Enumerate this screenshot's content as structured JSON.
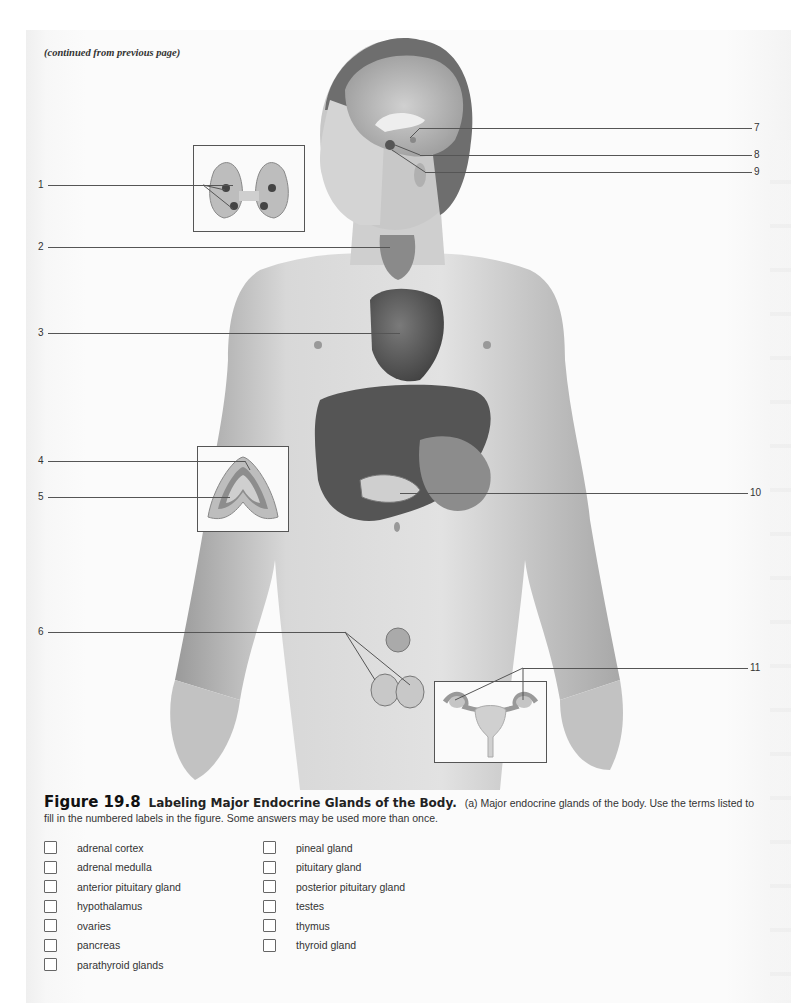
{
  "header": {
    "continued_note": "(continued from previous page)"
  },
  "figure": {
    "labels_left": [
      {
        "num": "1",
        "y": 185,
        "line_end": 233
      },
      {
        "num": "2",
        "y": 247,
        "line_end": 390
      },
      {
        "num": "3",
        "y": 333,
        "line_end": 400
      },
      {
        "num": "4",
        "y": 461,
        "line_end": 245
      },
      {
        "num": "5",
        "y": 497,
        "line_end": 230
      },
      {
        "num": "6",
        "y": 632,
        "line_end": 345
      }
    ],
    "labels_right": [
      {
        "num": "7",
        "y": 128,
        "line_start": 420
      },
      {
        "num": "8",
        "y": 155,
        "line_start": 420
      },
      {
        "num": "9",
        "y": 172,
        "line_start": 425
      },
      {
        "num": "10",
        "y": 493,
        "line_start": 400
      },
      {
        "num": "11",
        "y": 668,
        "line_start": 523
      }
    ],
    "insets": [
      {
        "name": "thyroid-parathyroid-inset",
        "depicts": "posterior thyroid with parathyroid glands"
      },
      {
        "name": "adrenal-gland-inset",
        "depicts": "adrenal gland cross section"
      },
      {
        "name": "female-reproductive-inset",
        "depicts": "uterus and ovaries"
      }
    ],
    "illustration": "male human body with endocrine glands: brain (hypothalamus, pituitary, pineal), thyroid, thymus/heart, liver, pancreas, testes"
  },
  "caption": {
    "figure_number": "Figure 19.8",
    "figure_title": "Labeling Major Endocrine Glands of the Body.",
    "text": "(a) Major endocrine glands of the body.  Use the terms listed to fill in the numbered labels in the figure. Some answers may be used more than once."
  },
  "terms": {
    "column1": [
      "adrenal cortex",
      "adrenal medulla",
      "anterior pituitary gland",
      "hypothalamus",
      "ovaries",
      "pancreas",
      "parathyroid glands"
    ],
    "column2": [
      "pineal gland",
      "pituitary gland",
      "posterior pituitary gland",
      "testes",
      "thymus",
      "thyroid gland"
    ]
  }
}
